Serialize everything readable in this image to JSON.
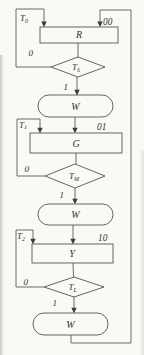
{
  "diagram": {
    "kind": "asm-flowchart",
    "ink": "#55555a",
    "background": "#f9f9f6",
    "sections": [
      {
        "state_box": "R",
        "state_code": "00",
        "entry_timer": {
          "base": "T",
          "sub": "0"
        },
        "decision": {
          "base": "T",
          "sub": "S"
        },
        "branch_no": "0",
        "branch_yes": "1",
        "wait_box": "W"
      },
      {
        "state_box": "G",
        "state_code": "01",
        "entry_timer": {
          "base": "T",
          "sub": "1"
        },
        "decision": {
          "base": "T",
          "sub": "M"
        },
        "branch_no": "0",
        "branch_yes": "1",
        "wait_box": "W"
      },
      {
        "state_box": "Y",
        "state_code": "10",
        "entry_timer": {
          "base": "T",
          "sub": "2"
        },
        "decision": {
          "base": "T",
          "sub": "L"
        },
        "branch_no": "0",
        "branch_yes": "1",
        "wait_box": "W"
      }
    ]
  }
}
